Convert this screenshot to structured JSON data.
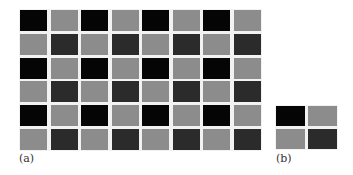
{
  "colors": {
    "black": "#050505",
    "gray": "#8c8c8c",
    "dark": "#2b2b2b",
    "gutter": "#f2f2f2"
  },
  "panel_a": {
    "label": "(a)",
    "rows": 6,
    "cols": 8,
    "pattern": [
      [
        "black",
        "gray",
        "black",
        "gray",
        "black",
        "gray",
        "black",
        "gray"
      ],
      [
        "gray",
        "dark",
        "gray",
        "dark",
        "gray",
        "dark",
        "gray",
        "dark"
      ],
      [
        "black",
        "gray",
        "black",
        "gray",
        "black",
        "gray",
        "black",
        "gray"
      ],
      [
        "gray",
        "dark",
        "gray",
        "dark",
        "gray",
        "dark",
        "gray",
        "dark"
      ],
      [
        "black",
        "gray",
        "black",
        "gray",
        "black",
        "gray",
        "black",
        "gray"
      ],
      [
        "gray",
        "dark",
        "gray",
        "dark",
        "gray",
        "dark",
        "gray",
        "dark"
      ]
    ]
  },
  "panel_b": {
    "label": "(b)",
    "rows": 2,
    "cols": 2,
    "pattern": [
      [
        "black",
        "gray"
      ],
      [
        "gray",
        "dark"
      ]
    ]
  }
}
